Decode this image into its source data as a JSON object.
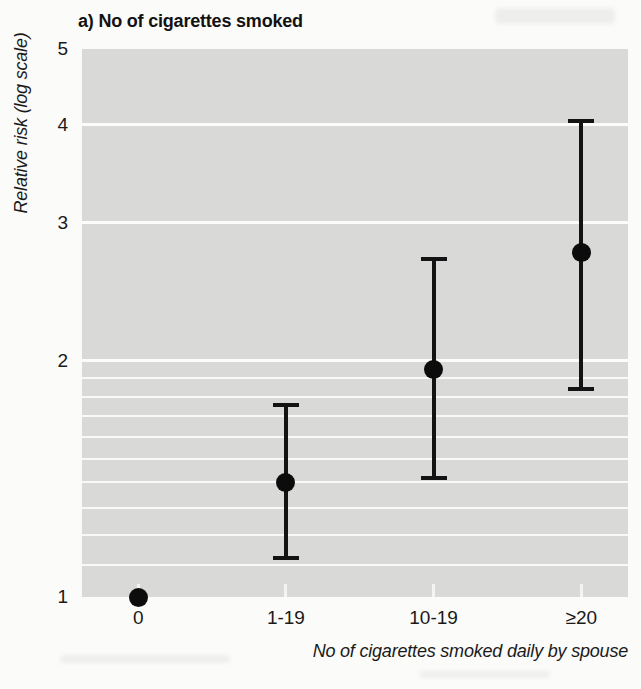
{
  "figure": {
    "title": "a) No of cigarettes smoked"
  },
  "chart_data": {
    "type": "scatter",
    "subtype": "point-estimates-with-error-bars",
    "title": "a) No of cigarettes smoked",
    "xlabel": "No of cigarettes smoked daily by spouse",
    "ylabel": "Relative risk (log scale)",
    "y_scale": "log",
    "ylim": [
      1,
      5
    ],
    "y_ticks": [
      5,
      4,
      3,
      2,
      1
    ],
    "minor_gridlines": [
      1.1,
      1.2,
      1.3,
      1.4,
      1.5,
      1.6,
      1.7,
      1.8,
      1.9
    ],
    "major_gridlines": [
      2,
      3,
      4
    ],
    "grid": "horizontal white lines on gray panel",
    "legend_position": "none",
    "categories": [
      "0",
      "1-19",
      "10-19",
      "≥20"
    ],
    "series": [
      {
        "name": "Relative risk",
        "points": [
          {
            "category": "0",
            "value": 1.0,
            "ci_low": null,
            "ci_high": null
          },
          {
            "category": "1-19",
            "value": 1.4,
            "ci_low": 1.12,
            "ci_high": 1.76
          },
          {
            "category": "10-19",
            "value": 1.95,
            "ci_low": 1.42,
            "ci_high": 2.7
          },
          {
            "category": "≥20",
            "value": 2.75,
            "ci_low": 1.84,
            "ci_high": 4.05
          }
        ]
      }
    ]
  },
  "colors": {
    "page_background": "#fbfbf9",
    "panel_background": "#d9d9d7",
    "gridline": "#fcfcfa",
    "ink": "#131313"
  }
}
